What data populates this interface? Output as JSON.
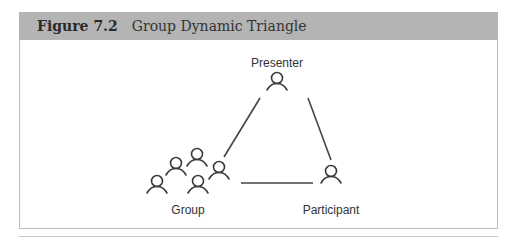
{
  "figure": {
    "number": "Figure 7.2",
    "title": "Group Dynamic Triangle"
  },
  "diagram": {
    "nodes": [
      {
        "id": "presenter",
        "label": "Presenter",
        "icon": "person-icon"
      },
      {
        "id": "participant",
        "label": "Participant",
        "icon": "person-icon"
      },
      {
        "id": "group",
        "label": "Group",
        "icon": "people-group-icon",
        "member_count": 5
      }
    ],
    "edges": [
      {
        "from": "group",
        "to": "presenter"
      },
      {
        "from": "presenter",
        "to": "participant"
      },
      {
        "from": "group",
        "to": "participant"
      }
    ],
    "colors": {
      "line": "#444444",
      "header": "#b4b4b4"
    }
  }
}
